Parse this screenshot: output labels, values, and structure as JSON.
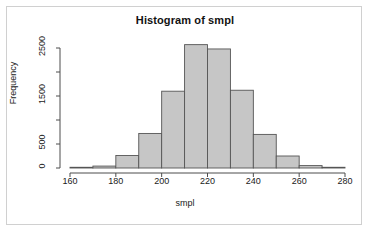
{
  "chart_data": {
    "type": "bar",
    "title": "Histogram of smpl",
    "xlabel": "smpl",
    "ylabel": "Frequency",
    "categories": [
      "160-170",
      "170-180",
      "180-190",
      "190-200",
      "200-210",
      "210-220",
      "220-230",
      "230-240",
      "240-250",
      "250-260",
      "260-270",
      "270-280"
    ],
    "bin_edges": [
      160,
      170,
      180,
      190,
      200,
      210,
      220,
      230,
      240,
      250,
      260,
      270,
      280
    ],
    "values": [
      15,
      40,
      260,
      720,
      1600,
      2570,
      2480,
      1620,
      700,
      250,
      50,
      15
    ],
    "xlim": [
      160,
      280
    ],
    "ylim": [
      0,
      2600
    ],
    "xticks": [
      160,
      180,
      200,
      220,
      240,
      260,
      280
    ],
    "xtick_labels": [
      "160",
      "180",
      "200",
      "220",
      "240",
      "260",
      "280"
    ],
    "yticks": [
      0,
      500,
      1000,
      1500,
      2000,
      2500
    ],
    "ytick_labels": [
      "0",
      "500",
      "",
      "1500",
      "",
      "2500"
    ],
    "grid": false,
    "legend": null,
    "bar_fill": "#c6c6c6",
    "bar_stroke": "#555555",
    "axis_color": "#4d4d4d",
    "text_color": "#1a1a1a",
    "background": "#ffffff",
    "frame_border": "#d0d0d0"
  }
}
